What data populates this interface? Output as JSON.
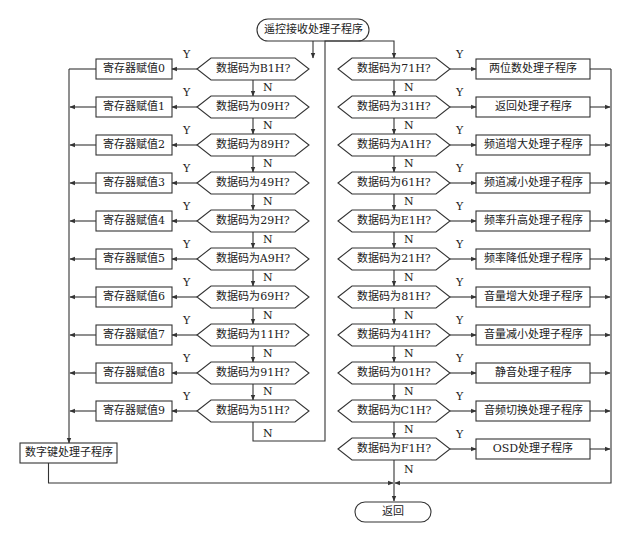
{
  "start": {
    "label": "遥控接收处理子程序"
  },
  "end": {
    "label": "返回"
  },
  "labels": {
    "yes": "Y",
    "no": "N"
  },
  "left_column": {
    "decisions": [
      {
        "question": "数据码为B1H?",
        "action": "寄存器赋值0"
      },
      {
        "question": "数据码为09H?",
        "action": "寄存器赋值1"
      },
      {
        "question": "数据码为89H?",
        "action": "寄存器赋值2"
      },
      {
        "question": "数据码为49H?",
        "action": "寄存器赋值3"
      },
      {
        "question": "数据码为29H?",
        "action": "寄存器赋值4"
      },
      {
        "question": "数据码为A9H?",
        "action": "寄存器赋值5"
      },
      {
        "question": "数据码为69H?",
        "action": "寄存器赋值6"
      },
      {
        "question": "数据码为11H?",
        "action": "寄存器赋值7"
      },
      {
        "question": "数据码为91H?",
        "action": "寄存器赋值8"
      },
      {
        "question": "数据码为51H?",
        "action": "寄存器赋值9"
      }
    ],
    "merge_action": "数字键处理子程序"
  },
  "right_column": {
    "decisions": [
      {
        "question": "数据码为71H?",
        "action": "两位数处理子程序"
      },
      {
        "question": "数据码为31H?",
        "action": "返回处理子程序"
      },
      {
        "question": "数据码为A1H?",
        "action": "频道增大处理子程序"
      },
      {
        "question": "数据码为61H?",
        "action": "频道减小处理子程序"
      },
      {
        "question": "数据码为E1H?",
        "action": "频率升高处理子程序"
      },
      {
        "question": "数据码为21H?",
        "action": "频率降低处理子程序"
      },
      {
        "question": "数据码为81H?",
        "action": "音量增大处理子程序"
      },
      {
        "question": "数据码为41H?",
        "action": "音量减小处理子程序"
      },
      {
        "question": "数据码为01H?",
        "action": "静音处理子程序"
      },
      {
        "question": "数据码为C1H?",
        "action": "音频切换处理子程序"
      },
      {
        "question": "数据码为F1H?",
        "action": "OSD处理子程序"
      }
    ]
  },
  "colors": {
    "line": "#333333",
    "background": "#ffffff"
  }
}
